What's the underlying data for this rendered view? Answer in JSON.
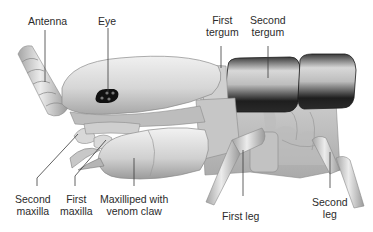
{
  "diagram": {
    "labels": {
      "antenna": "Antenna",
      "eye": "Eye",
      "first_tergum": [
        "First",
        "tergum"
      ],
      "second_tergum": [
        "Second",
        "tergum"
      ],
      "second_maxilla": [
        "Second",
        "maxilla"
      ],
      "first_maxilla": [
        "First",
        "maxilla"
      ],
      "maxilliped": [
        "Maxilliped with",
        "venom claw"
      ],
      "first_leg": "First leg",
      "second_leg": [
        "Second",
        "leg"
      ]
    },
    "colors": {
      "background": "#ffffff",
      "body_light": "#e6e6e6",
      "body_mid": "#c4c4c4",
      "body_dark": "#8a8a8a",
      "tergum_dark": "#2a2a2a",
      "eye": "#111111",
      "leader_line": "#3a3a3a",
      "label_text": "#2b2b2b"
    }
  }
}
